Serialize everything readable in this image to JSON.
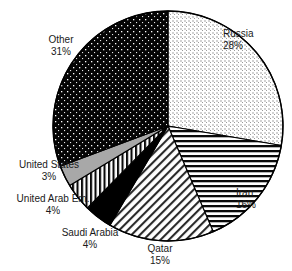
{
  "chart_data": {
    "type": "pie",
    "title": "",
    "subtitle": "",
    "xlabel": "",
    "ylabel": "",
    "legend_position": "none",
    "grid": false,
    "start_angle_deg": 0,
    "direction": "clockwise",
    "units": "percent",
    "categories": [
      "Russia",
      "Iran",
      "Qatar",
      "Saudi Arabia",
      "United Arab Em.",
      "United States",
      "Other"
    ],
    "values": [
      28,
      16,
      15,
      4,
      4,
      3,
      31
    ],
    "slices": [
      {
        "label": "Russia",
        "value": 28,
        "value_text": "28%",
        "pattern": "fine-dots-light",
        "fill": "#ffffff",
        "ink": "#6e6e6e"
      },
      {
        "label": "Iran",
        "value": 16,
        "value_text": "16%",
        "pattern": "horizontal-lines",
        "fill": "#ffffff",
        "ink": "#000000"
      },
      {
        "label": "Qatar",
        "value": 15,
        "value_text": "15%",
        "pattern": "diagonal-hatch",
        "fill": "#ffffff",
        "ink": "#2b2b2b"
      },
      {
        "label": "Saudi Arabia",
        "value": 4,
        "value_text": "4%",
        "pattern": "solid-black",
        "fill": "#000000",
        "ink": "#000000"
      },
      {
        "label": "United Arab Em.",
        "value": 4,
        "value_text": "4%",
        "pattern": "vertical-lines",
        "fill": "#ffffff",
        "ink": "#000000"
      },
      {
        "label": "United States",
        "value": 3,
        "value_text": "3%",
        "pattern": "solid-gray",
        "fill": "#a8a8a8",
        "ink": "#a8a8a8"
      },
      {
        "label": "Other",
        "value": 31,
        "value_text": "31%",
        "pattern": "dark-dots",
        "fill": "#050505",
        "ink": "#ffffff"
      }
    ],
    "outline_color": "#000000"
  },
  "labels": {
    "russia": {
      "name": "Russia",
      "value": "28%"
    },
    "iran": {
      "name": "Iran",
      "value": "16%"
    },
    "qatar": {
      "name": "Qatar",
      "value": "15%"
    },
    "saudi_arabia": {
      "name": "Saudi Arabia",
      "value": "4%"
    },
    "uae": {
      "name": "United Arab Em.",
      "value": "4%"
    },
    "united_states": {
      "name": "United States",
      "value": "3%"
    },
    "other": {
      "name": "Other",
      "value": "31%"
    }
  },
  "footnote": {
    "text": ""
  }
}
